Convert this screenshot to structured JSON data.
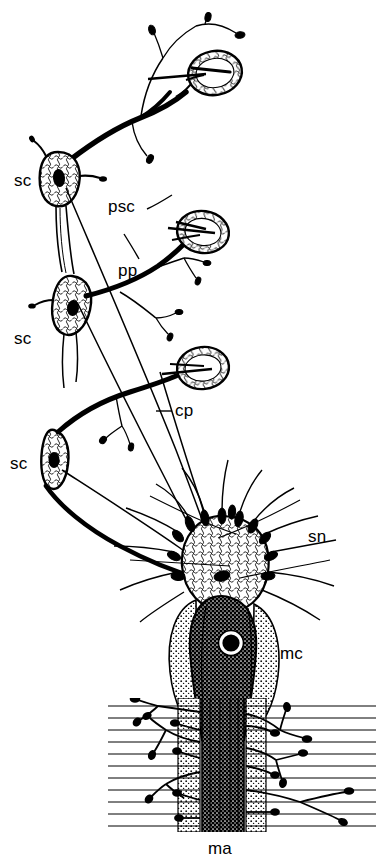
{
  "figure": {
    "kind": "line-drawing",
    "ink_color": "#000000",
    "background_color": "#ffffff"
  },
  "labels": [
    {
      "key": "sc1",
      "text": "sc",
      "x": 14,
      "y": 172,
      "leader": false
    },
    {
      "key": "psc",
      "text": "psc",
      "x": 108,
      "y": 198,
      "leader": true
    },
    {
      "key": "pp",
      "text": "pp",
      "x": 118,
      "y": 262,
      "leader": true
    },
    {
      "key": "sc2",
      "text": "sc",
      "x": 14,
      "y": 330,
      "leader": false
    },
    {
      "key": "cp",
      "text": "cp",
      "x": 175,
      "y": 402,
      "leader": true
    },
    {
      "key": "sc3",
      "text": "sc",
      "x": 10,
      "y": 455,
      "leader": false
    },
    {
      "key": "sn",
      "text": "sn",
      "x": 308,
      "y": 528,
      "leader": false
    },
    {
      "key": "mc",
      "text": "mc",
      "x": 280,
      "y": 645,
      "leader": false
    },
    {
      "key": "ma",
      "text": "ma",
      "x": 208,
      "y": 840,
      "leader": false
    }
  ],
  "structures": {
    "sensory_cells": [
      {
        "key": "sc1",
        "cx": 58,
        "cy": 178,
        "rx": 20,
        "ry": 26,
        "rot": -8
      },
      {
        "key": "sc2",
        "cx": 72,
        "cy": 300,
        "rx": 19,
        "ry": 25,
        "rot": 6
      },
      {
        "key": "sc3",
        "cx": 54,
        "cy": 458,
        "rx": 15,
        "ry": 27,
        "rot": -4
      }
    ],
    "corpuscles": [
      {
        "key": "psc1",
        "cx": 215,
        "cy": 73,
        "rx": 27,
        "ry": 22,
        "rot": -10
      },
      {
        "key": "psc2",
        "cx": 203,
        "cy": 232,
        "rx": 26,
        "ry": 21,
        "rot": 8
      },
      {
        "key": "psc3",
        "cx": 203,
        "cy": 368,
        "rx": 26,
        "ry": 21,
        "rot": -6
      }
    ],
    "mantle_cell": {
      "cx": 222,
      "cy": 650,
      "rx": 44,
      "ry": 60,
      "nucleus_r": 11
    },
    "sensory_terminal": {
      "cx": 224,
      "cy": 562,
      "rx": 40,
      "ry": 42
    },
    "muscle_band": {
      "x": 108,
      "y": 700,
      "w": 268,
      "h": 130,
      "fiber_count": 22
    }
  }
}
